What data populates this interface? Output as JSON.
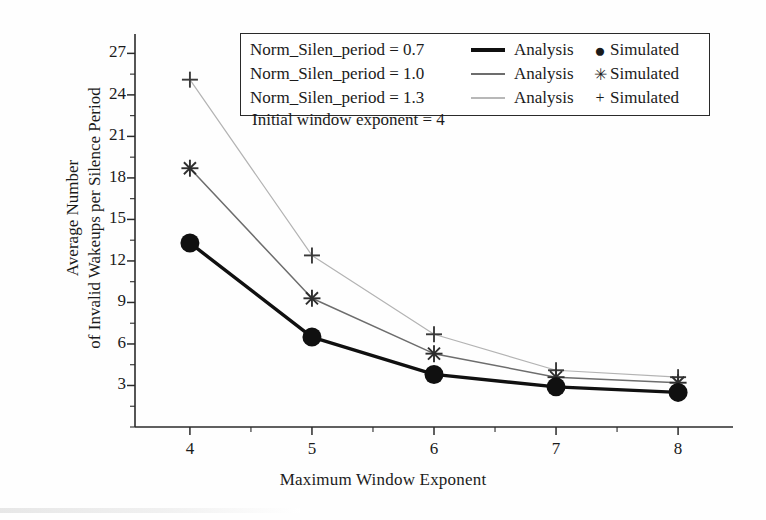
{
  "chart_data": {
    "type": "line",
    "title": "",
    "xlabel": "Maximum Window Exponent",
    "ylabel_lines": [
      "Average Number",
      "of Invalid Wakeups per Silence Period"
    ],
    "x": [
      4,
      5,
      6,
      7,
      8
    ],
    "xlim": [
      3.55,
      8.45
    ],
    "ylim": [
      0,
      28.4
    ],
    "xticks": [
      4,
      5,
      6,
      7,
      8
    ],
    "yticks": [
      3,
      6,
      9,
      12,
      15,
      18,
      21,
      24,
      27
    ],
    "ytick_minor_step": 1.5,
    "grid": false,
    "legend_position": "top-center-inside",
    "annotation": "Initial window exponent = 4",
    "series": [
      {
        "name": "Norm_Silen_period = 0.7",
        "analysis_label": "Analysis",
        "simulated_label": "Simulated",
        "marker": "circle",
        "color": "#101010",
        "line_width": 3.4,
        "values": [
          13.3,
          6.5,
          3.8,
          2.9,
          2.5
        ]
      },
      {
        "name": "Norm_Silen_period = 1.0",
        "analysis_label": "Analysis",
        "simulated_label": "Simulated",
        "marker": "asterisk",
        "color": "#6d6d6d",
        "line_width": 1.5,
        "values": [
          18.7,
          9.3,
          5.3,
          3.6,
          3.2
        ]
      },
      {
        "name": "Norm_Silen_period = 1.3",
        "analysis_label": "Analysis",
        "simulated_label": "Simulated",
        "marker": "plus",
        "color": "#b3b3b3",
        "line_width": 1.2,
        "values": [
          25.1,
          12.4,
          6.7,
          4.1,
          3.6
        ]
      }
    ]
  },
  "legend": {
    "rows": [
      {
        "label": "Norm_Silen_period = 0.7",
        "analysis": "Analysis",
        "simulated": "Simulated",
        "marker_glyph": "●"
      },
      {
        "label": "Norm_Silen_period = 1.0",
        "analysis": "Analysis",
        "simulated": "Simulated",
        "marker_glyph": "✳"
      },
      {
        "label": "Norm_Silen_period = 1.3",
        "analysis": "Analysis",
        "simulated": "Simulated",
        "marker_glyph": "+"
      }
    ]
  },
  "axes": {
    "x_title": "Maximum Window Exponent",
    "y_title_line1": "Average Number",
    "y_title_line2": "of Invalid Wakeups per Silence Period",
    "x_tick_labels": [
      "4",
      "5",
      "6",
      "7",
      "8"
    ],
    "y_tick_labels": [
      "3",
      "6",
      "9",
      "12",
      "15",
      "18",
      "21",
      "24",
      "27"
    ]
  },
  "annotation": {
    "text": "Initial window exponent = 4"
  }
}
